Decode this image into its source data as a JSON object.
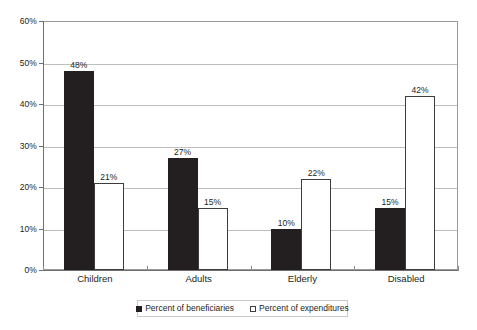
{
  "chart_data": {
    "type": "bar",
    "title": "",
    "subtitle": "",
    "xlabel": "",
    "ylabel": "",
    "categories": [
      "Children",
      "Adults",
      "Elderly",
      "Disabled"
    ],
    "series": [
      {
        "name": "Percent of beneficiaries",
        "swatch": "filled-black-square",
        "color": "#231f20",
        "values": [
          48,
          27,
          10,
          15
        ],
        "labels": [
          "48%",
          "27%",
          "10%",
          "15%"
        ]
      },
      {
        "name": "Percent of expenditures",
        "swatch": "open-white-square",
        "color": "#ffffff",
        "values": [
          21,
          15,
          22,
          42
        ],
        "labels": [
          "21%",
          "15%",
          "22%",
          "42%"
        ]
      }
    ],
    "ylim": [
      0,
      60
    ],
    "ytick_values": [
      0,
      10,
      20,
      30,
      40,
      50,
      60
    ],
    "ytick_labels": [
      "0%",
      "10%",
      "20%",
      "30%",
      "40%",
      "50%",
      "60%"
    ],
    "grid": "horizontal",
    "legend_position": "bottom",
    "value_labels_shown": true
  }
}
